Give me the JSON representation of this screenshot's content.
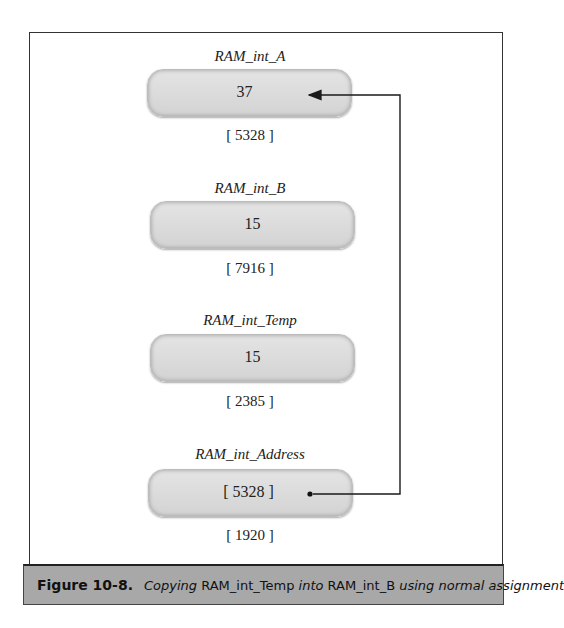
{
  "figure": {
    "caption_label": "Figure 10-8.",
    "caption_parts": [
      {
        "text": "Copying ",
        "italic": true
      },
      {
        "text": "RAM_int_Temp",
        "italic": false
      },
      {
        "text": " into ",
        "italic": true
      },
      {
        "text": "RAM_int_B",
        "italic": false
      },
      {
        "text": " using normal assignment",
        "italic": true
      }
    ]
  },
  "variables": [
    {
      "name": "RAM_int_A",
      "value": "37",
      "address": "[ 5328 ]"
    },
    {
      "name": "RAM_int_B",
      "value": "15",
      "address": "[ 7916 ]"
    },
    {
      "name": "RAM_int_Temp",
      "value": "15",
      "address": "[ 2385 ]"
    },
    {
      "name": "RAM_int_Address",
      "value": "[ 5328 ]",
      "address": "[ 1920 ]"
    }
  ],
  "connector": {
    "from": "RAM_int_Address",
    "to": "RAM_int_A",
    "style": "pointer-arrow"
  }
}
